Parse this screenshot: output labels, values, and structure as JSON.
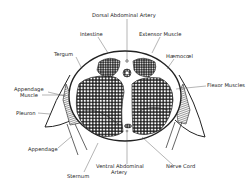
{
  "diagram": {
    "labels": {
      "dorsal_artery": "Dorsal Abdominal Artery",
      "intestine": "Intestine",
      "extensor": "Extensor Muscle",
      "tergum": "Tergum",
      "haemocoel": "Hæmocœl",
      "appendage_muscle_1": "Appendage",
      "appendage_muscle_2": "Muscle",
      "flexor": "Flexor Muscles",
      "pleuron": "Pleuron",
      "appendage": "Appendage",
      "ventral_artery_1": "Ventral Abdominal",
      "ventral_artery_2": "Artery",
      "nerve_cord": "Nerve Cord",
      "sternum": "Sternum"
    },
    "colors": {
      "ink": "#222222",
      "background": "#ffffff"
    }
  }
}
